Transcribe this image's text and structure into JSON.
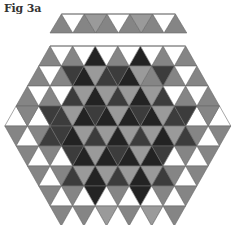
{
  "figure": {
    "title": "Fig 3a"
  },
  "palette": {
    "W": "#ffffff",
    "L": "#9a9a9a",
    "G": "#858585",
    "D": "#3c3c3c",
    "K": "#232323",
    "stroke": "#6a6a6a"
  },
  "strip": {
    "up": [
      "G",
      "G",
      "G",
      "G",
      "G",
      "G"
    ],
    "down": [
      "W",
      "L",
      "W",
      "L",
      "W"
    ]
  },
  "hexagon": {
    "rows": [
      {
        "up": [
          "G",
          "G",
          "K",
          "G",
          "K",
          "G",
          "G"
        ],
        "down": [
          "W",
          "W",
          "W",
          "W",
          "W",
          "W"
        ]
      },
      {
        "up": [
          "G",
          "G",
          "K",
          "D",
          "K",
          "G",
          "G",
          "G"
        ],
        "down": [
          "W",
          "D",
          "L",
          "D",
          "L",
          "D",
          "W"
        ]
      },
      {
        "up": [
          "G",
          "G",
          "D",
          "K",
          "D",
          "K",
          "D",
          "G",
          "G"
        ],
        "down": [
          "W",
          "W",
          "L",
          "L",
          "L",
          "L",
          "W",
          "W"
        ]
      },
      {
        "up": [
          "W",
          "W",
          "D",
          "K",
          "K",
          "K",
          "K",
          "D",
          "W",
          "W"
        ],
        "down": [
          "G",
          "D",
          "L",
          "D",
          "L",
          "D",
          "L",
          "D",
          "G"
        ]
      },
      {
        "up": [
          "W",
          "D",
          "K",
          "D",
          "K",
          "D",
          "K",
          "D",
          "W"
        ],
        "down": [
          "G",
          "G",
          "D",
          "L",
          "L",
          "L",
          "L",
          "L",
          "G",
          "G"
        ]
      },
      {
        "up": [
          "W",
          "W",
          "K",
          "K",
          "K",
          "K",
          "W",
          "W"
        ],
        "down": [
          "G",
          "G",
          "D",
          "L",
          "D",
          "L",
          "D",
          "G",
          "G"
        ]
      },
      {
        "up": [
          "W",
          "D",
          "K",
          "D",
          "K",
          "D",
          "W"
        ],
        "down": [
          "G",
          "G",
          "L",
          "L",
          "L",
          "L",
          "G",
          "G"
        ]
      },
      {
        "up": [
          "W",
          "W",
          "W",
          "W",
          "W",
          "W"
        ],
        "down": [
          "G",
          "G",
          "K",
          "G",
          "K",
          "G",
          "G"
        ]
      },
      {
        "up": [
          "W",
          "W",
          "W",
          "W",
          "W"
        ],
        "down": [
          "G",
          "G",
          "L",
          "G",
          "L",
          "G"
        ]
      }
    ]
  }
}
